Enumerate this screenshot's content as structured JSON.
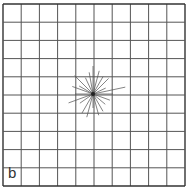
{
  "figure": {
    "panel_label": "b",
    "grid": {
      "columns": 10,
      "rows": 10,
      "left": 3,
      "top": 4,
      "right": 185,
      "bottom": 186,
      "line_color": "#555555",
      "border_color": "#333333"
    },
    "starburst": {
      "center": [
        93,
        94
      ],
      "color": "#555555",
      "rays": [
        {
          "angle": 0,
          "length": 20
        },
        {
          "angle": 12,
          "length": 33
        },
        {
          "angle": 25,
          "length": 14
        },
        {
          "angle": 45,
          "length": 22
        },
        {
          "angle": 60,
          "length": 20
        },
        {
          "angle": 75,
          "length": 24
        },
        {
          "angle": 90,
          "length": 28
        },
        {
          "angle": 100,
          "length": 22
        },
        {
          "angle": 115,
          "length": 18
        },
        {
          "angle": 135,
          "length": 26
        },
        {
          "angle": 150,
          "length": 16
        },
        {
          "angle": 160,
          "length": 22
        },
        {
          "angle": 180,
          "length": 18
        },
        {
          "angle": 200,
          "length": 26
        },
        {
          "angle": 215,
          "length": 16
        },
        {
          "angle": 240,
          "length": 22
        },
        {
          "angle": 255,
          "length": 24
        },
        {
          "angle": 270,
          "length": 14
        },
        {
          "angle": 285,
          "length": 22
        },
        {
          "angle": 300,
          "length": 20
        },
        {
          "angle": 320,
          "length": 16
        },
        {
          "angle": 340,
          "length": 18
        }
      ]
    }
  }
}
